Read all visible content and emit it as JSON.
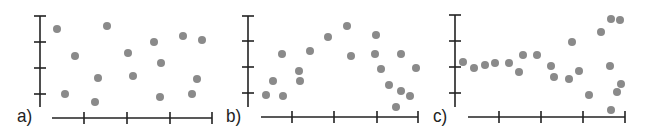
{
  "chart_data": [
    {
      "type": "scatter",
      "label": "a)",
      "title": "",
      "xlabel": "",
      "ylabel": "",
      "grid": false,
      "axes": {
        "yaxis_x": 40,
        "yaxis_top": 16,
        "yaxis_bottom": 107,
        "yticks_px": [
          16,
          42,
          68,
          94
        ],
        "xaxis_y": 118,
        "xaxis_left": 52,
        "xaxis_right": 212,
        "xticks_px": [
          84,
          127,
          170,
          212
        ]
      },
      "label_pos": [
        17,
        106
      ],
      "points_px": [
        [
          57,
          29
        ],
        [
          107,
          26
        ],
        [
          75,
          56
        ],
        [
          128,
          53
        ],
        [
          154,
          42
        ],
        [
          183,
          36
        ],
        [
          202,
          40
        ],
        [
          161,
          63
        ],
        [
          98,
          78
        ],
        [
          133,
          76
        ],
        [
          197,
          79
        ],
        [
          65,
          94
        ],
        [
          95,
          102
        ],
        [
          160,
          97
        ],
        [
          192,
          94
        ]
      ],
      "description": "No association: points randomly scattered"
    },
    {
      "type": "scatter",
      "label": "b)",
      "title": "",
      "xlabel": "",
      "ylabel": "",
      "grid": false,
      "axes": {
        "yaxis_x": 248,
        "yaxis_top": 16,
        "yaxis_bottom": 107,
        "yticks_px": [
          16,
          41,
          67,
          93
        ],
        "xaxis_y": 117,
        "xaxis_left": 261,
        "xaxis_right": 418,
        "xticks_px": [
          292,
          334,
          377,
          418
        ]
      },
      "label_pos": [
        226,
        106
      ],
      "points_px": [
        [
          266,
          95
        ],
        [
          273,
          81
        ],
        [
          282,
          54
        ],
        [
          283,
          96
        ],
        [
          299,
          71
        ],
        [
          300,
          81
        ],
        [
          310,
          51
        ],
        [
          328,
          37
        ],
        [
          347,
          26
        ],
        [
          351,
          56
        ],
        [
          376,
          35
        ],
        [
          375,
          54
        ],
        [
          381,
          69
        ],
        [
          389,
          85
        ],
        [
          401,
          54
        ],
        [
          416,
          68
        ],
        [
          401,
          91
        ],
        [
          410,
          96
        ],
        [
          396,
          107
        ]
      ],
      "description": "Curved (non-linear) association: rises then falls"
    },
    {
      "type": "scatter",
      "label": "c)",
      "title": "",
      "xlabel": "",
      "ylabel": "",
      "grid": false,
      "axes": {
        "yaxis_x": 455,
        "yaxis_top": 15,
        "yaxis_bottom": 107,
        "yticks_px": [
          15,
          41,
          67,
          93
        ],
        "xaxis_y": 117,
        "xaxis_left": 468,
        "xaxis_right": 625,
        "xticks_px": [
          499,
          541,
          583,
          625
        ]
      },
      "label_pos": [
        433,
        106
      ],
      "points_px": [
        [
          463,
          62
        ],
        [
          474,
          68
        ],
        [
          485,
          65
        ],
        [
          495,
          63
        ],
        [
          509,
          63
        ],
        [
          519,
          72
        ],
        [
          523,
          55
        ],
        [
          537,
          55
        ],
        [
          551,
          66
        ],
        [
          554,
          77
        ],
        [
          569,
          79
        ],
        [
          572,
          42
        ],
        [
          579,
          71
        ],
        [
          589,
          95
        ],
        [
          601,
          32
        ],
        [
          611,
          19
        ],
        [
          620,
          20
        ],
        [
          610,
          66
        ],
        [
          621,
          84
        ],
        [
          617,
          92
        ],
        [
          611,
          110
        ]
      ],
      "description": "Constant then increasing spread (fan shape) toward the right"
    }
  ],
  "style": {
    "axis_color": "#222222",
    "point_color": "#8a8a8a",
    "point_radius": 4,
    "tick_half_len": 6
  }
}
